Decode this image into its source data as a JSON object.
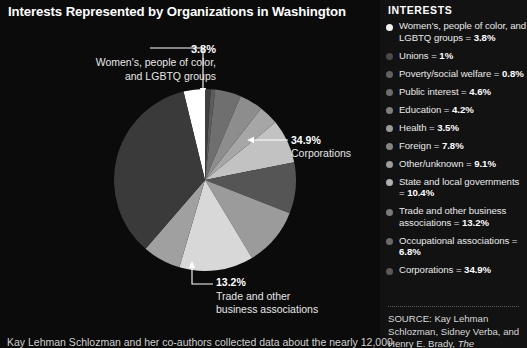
{
  "chart_title": "Interests Represented by Organizations in Washington",
  "legend_heading": "INTERESTS",
  "callouts": {
    "women": {
      "pct": "3.8%",
      "desc": "Women's, people of color,\nand LGBTQ groups"
    },
    "corporations": {
      "pct": "34.9%",
      "desc": "Corporations"
    },
    "trade": {
      "pct": "13.2%",
      "desc": "Trade and other\nbusiness associations"
    }
  },
  "source": {
    "label": "SOURCE:",
    "text": "SOURCE: Kay Lehman Schlozman, Sidney Verba, and Henry E. Brady, The Unheavenly"
  },
  "bottom_caption": "Kay Lehman Schlozman and her co-authors collected data about the nearly 12,000",
  "chart_data": {
    "type": "pie",
    "title": "Interests Represented by Organizations in Washington",
    "ylabel": "",
    "xlabel": "",
    "legend_position": "right",
    "grid": false,
    "labels": [
      "Women's, people of color, and LGBTQ groups",
      "Unions",
      "Poverty/social welfare",
      "Public interest",
      "Education",
      "Health",
      "Foreign",
      "Other/unknown",
      "State and local governments",
      "Trade and other business associations",
      "Occupational associations",
      "Corporations"
    ],
    "values": [
      3.8,
      1,
      0.8,
      4.6,
      4.2,
      3.5,
      7.8,
      9.1,
      10.4,
      13.2,
      6.8,
      34.9
    ],
    "value_strings": [
      "3.8%",
      "1%",
      "0.8%",
      "4.6%",
      "4.2%",
      "3.5%",
      "7.8%",
      "9.1%",
      "10.4%",
      "13.2%",
      "6.8%",
      "34.9%"
    ],
    "colors": [
      "#ffffff",
      "#3f3f3f",
      "#5c5c5c",
      "#6f6f6f",
      "#8d8d8d",
      "#a6a6a6",
      "#c2c2c2",
      "#555555",
      "#9b9b9b",
      "#d8d8d8",
      "#a0a0a0",
      "#3a3a3a"
    ]
  },
  "legend_items": [
    {
      "label": "Women's, people of color, and LGBTQ groups",
      "value": "3.8%",
      "color": "#f2f2f2"
    },
    {
      "label": "Unions",
      "value": "1%",
      "color": "#4a4a4a"
    },
    {
      "label": "Poverty/social welfare",
      "value": "0.8%",
      "color": "#616161"
    },
    {
      "label": "Public interest",
      "value": "4.6%",
      "color": "#6e6e6e"
    },
    {
      "label": "Education",
      "value": "4.2%",
      "color": "#7f7f7f"
    },
    {
      "label": "Health",
      "value": "3.5%",
      "color": "#9a9a9a"
    },
    {
      "label": "Foreign",
      "value": "7.8%",
      "color": "#848484"
    },
    {
      "label": "Other/unknown",
      "value": "9.1%",
      "color": "#9d9d9d"
    },
    {
      "label": "State and local governments",
      "value": "10.4%",
      "color": "#b0b0b0"
    },
    {
      "label": "Trade and other business associations",
      "value": "13.2%",
      "color": "#7a7a7a"
    },
    {
      "label": "Occupational associations",
      "value": "6.8%",
      "color": "#6a6a6a"
    },
    {
      "label": "Corporations",
      "value": "34.9%",
      "color": "#5a5a5a"
    }
  ]
}
